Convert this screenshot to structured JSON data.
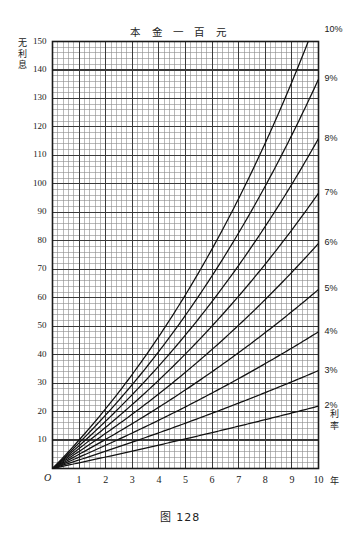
{
  "title": "本 金 一 百 元",
  "caption": "图 128",
  "y_axis_label_chars": [
    "无",
    "利",
    "息"
  ],
  "rate_axis_label_chars": [
    "利",
    "率"
  ],
  "origin_label": "O",
  "x_unit": "年",
  "y_ticks": [
    150,
    140,
    130,
    120,
    110,
    100,
    90,
    80,
    70,
    60,
    50,
    40,
    30,
    20,
    10
  ],
  "x_ticks": [
    0,
    1,
    2,
    3,
    4,
    5,
    6,
    7,
    8,
    9,
    10
  ],
  "rate_tags": [
    "10%",
    "9%",
    "8%",
    "7%",
    "6%",
    "5%",
    "4%",
    "3%",
    "2%"
  ],
  "colors": {
    "ink": "#1a1a1a",
    "grid_minor": "#8a8a8a",
    "grid_major": "#3a3a3a",
    "frame": "#1a1a1a",
    "curve": "#111111",
    "background": "#ffffff"
  },
  "chart_data": {
    "type": "line",
    "title": "本 金 一 百 元",
    "subtitle": "图 128",
    "xlabel": "年",
    "ylabel": "无利息",
    "xlim": [
      0,
      10
    ],
    "ylim": [
      0,
      150
    ],
    "x_tick_step": 1,
    "y_tick_step": 10,
    "grid": true,
    "grid_minor_divisions_x": 5,
    "grid_minor_divisions_y": 5,
    "legend_position": "right-axis-labels",
    "annotation": "复利增长：本金 100 元，利率 2%-10%，期限 10 年",
    "x": [
      0,
      1,
      2,
      3,
      4,
      5,
      6,
      7,
      8,
      9,
      10
    ],
    "series": [
      {
        "name": "2%",
        "label": "2%",
        "values": [
          0,
          2.0,
          4.0,
          6.1,
          8.2,
          10.4,
          12.6,
          14.9,
          17.2,
          19.5,
          21.9
        ]
      },
      {
        "name": "3%",
        "label": "3%",
        "values": [
          0,
          3.0,
          6.1,
          9.3,
          12.6,
          15.9,
          19.4,
          23.0,
          26.7,
          30.5,
          34.4
        ]
      },
      {
        "name": "4%",
        "label": "4%",
        "values": [
          0,
          4.0,
          8.2,
          12.5,
          17.0,
          21.7,
          26.5,
          31.6,
          36.9,
          42.3,
          48.0
        ]
      },
      {
        "name": "5%",
        "label": "5%",
        "values": [
          0,
          5.0,
          10.3,
          15.8,
          21.6,
          27.6,
          34.0,
          40.7,
          47.7,
          55.1,
          62.9
        ]
      },
      {
        "name": "6%",
        "label": "6%",
        "values": [
          0,
          6.0,
          12.4,
          19.1,
          26.2,
          33.8,
          41.9,
          50.4,
          59.4,
          69.0,
          79.1
        ]
      },
      {
        "name": "7%",
        "label": "7%",
        "values": [
          0,
          7.0,
          14.5,
          22.5,
          31.1,
          40.3,
          50.1,
          60.6,
          71.8,
          83.8,
          96.7
        ]
      },
      {
        "name": "8%",
        "label": "8%",
        "values": [
          0,
          8.0,
          16.6,
          26.0,
          36.0,
          46.9,
          58.7,
          71.4,
          85.1,
          99.9,
          115.9
        ]
      },
      {
        "name": "9%",
        "label": "9%",
        "values": [
          0,
          9.0,
          18.8,
          29.5,
          41.2,
          53.9,
          67.7,
          82.8,
          99.3,
          117.2,
          136.7
        ]
      },
      {
        "name": "10%",
        "label": "10%",
        "values": [
          0,
          10.0,
          21.0,
          33.1,
          46.4,
          61.1,
          77.2,
          94.9,
          114.4,
          135.8,
          159.4
        ]
      }
    ]
  }
}
